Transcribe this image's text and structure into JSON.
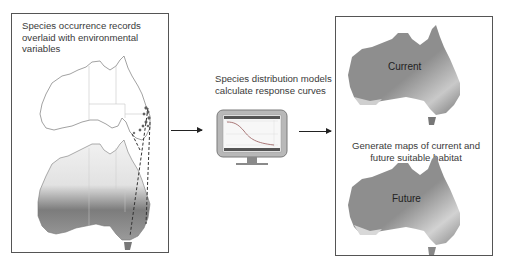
{
  "panels": {
    "input": {
      "caption": "Species occurrence records overlaid with environmental variables"
    },
    "model": {
      "caption": "Species distribution models calculate response curves",
      "icon": "monitor-with-response-curve"
    },
    "output": {
      "caption": "Generate maps of current and future suitable habitat",
      "maps": [
        {
          "label": "Current"
        },
        {
          "label": "Future"
        }
      ]
    }
  },
  "arrows": [
    {
      "from": "input",
      "to": "model"
    },
    {
      "from": "model",
      "to": "output"
    }
  ],
  "colors": {
    "border": "#555555",
    "map_dark": "#8a8a8a",
    "map_light": "#d6d6d6",
    "arrow": "#222222"
  }
}
